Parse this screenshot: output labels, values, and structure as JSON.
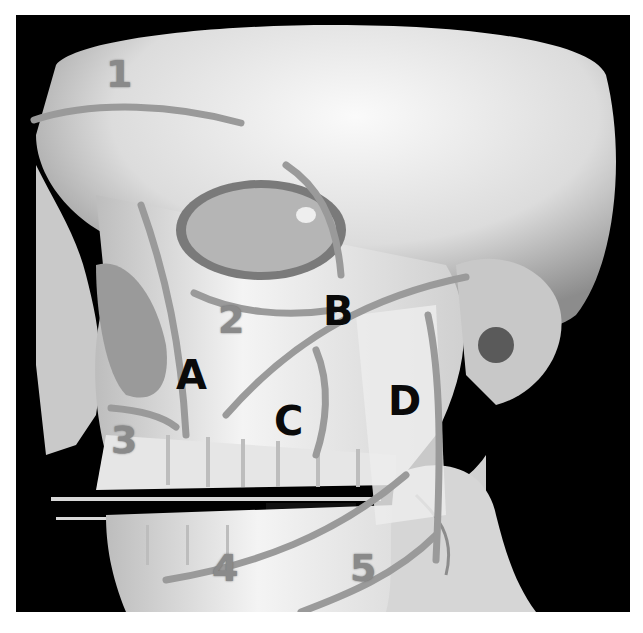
{
  "figure": {
    "numbered_lines": [
      {
        "label": "1"
      },
      {
        "label": "2"
      },
      {
        "label": "3"
      },
      {
        "label": "4"
      },
      {
        "label": "5"
      }
    ],
    "lettered_lines": [
      {
        "label": "A"
      },
      {
        "label": "B"
      },
      {
        "label": "C"
      },
      {
        "label": "D"
      }
    ],
    "colors": {
      "background": "#000000",
      "bone": "#e8e8e8",
      "annotation_line": "#9a9a9a",
      "numeral": "#8a8a8a",
      "letter": "#0a0a0a"
    }
  }
}
